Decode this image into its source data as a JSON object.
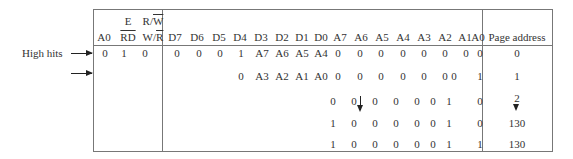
{
  "table": {
    "header": {
      "ctrl": {
        "a0": "A0",
        "e_top": "E",
        "e_bottom": "RD",
        "rw_top_prefix": "R/",
        "rw_top_over": "W",
        "rw_bottom_prefix": "W/",
        "rw_bottom_over": "R"
      },
      "data_cols": [
        "D7",
        "D6",
        "D5",
        "D4",
        "D3",
        "D2",
        "D1",
        "D0",
        "A7",
        "A6",
        "A5",
        "A4",
        "A3",
        "A2",
        "A1",
        "A0"
      ],
      "page_address": "Page address"
    },
    "rows": [
      {
        "ctrl": [
          "0",
          "1",
          "0"
        ],
        "data": [
          "0",
          "0",
          "0",
          "1",
          "A7",
          "A6",
          "A5",
          "A4",
          "0",
          "0",
          "0",
          "0",
          "0",
          "0",
          "0",
          "0"
        ],
        "page": "0"
      },
      {
        "ctrl": [
          "",
          "",
          ""
        ],
        "data": [
          "",
          "",
          "",
          "0",
          "A3",
          "A2",
          "A1",
          "A0",
          "0",
          "0",
          "0",
          "0",
          "0",
          "0",
          "0",
          "1"
        ],
        "page": "1"
      },
      {
        "ctrl": [
          "",
          "",
          ""
        ],
        "data": [
          "",
          "",
          "",
          "",
          "",
          "",
          "",
          "",
          "0",
          "0",
          "0",
          "0",
          "0",
          "0",
          "1",
          "0"
        ],
        "page": "2"
      },
      {
        "ctrl": [
          "",
          "",
          ""
        ],
        "data": [
          "",
          "",
          "",
          "",
          "",
          "",
          "",
          "",
          "1",
          "0",
          "0",
          "0",
          "0",
          "0",
          "1",
          "0"
        ],
        "page": "130"
      },
      {
        "ctrl": [
          "",
          "",
          ""
        ],
        "data": [
          "",
          "",
          "",
          "",
          "",
          "",
          "",
          "",
          "1",
          "0",
          "0",
          "0",
          "0",
          "0",
          "1",
          "1"
        ],
        "page": "130"
      }
    ]
  },
  "annotations": {
    "high_bits_label": "High hits"
  }
}
